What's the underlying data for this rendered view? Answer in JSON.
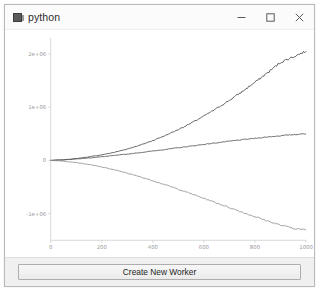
{
  "window": {
    "title": "python",
    "icon": "python-app-icon",
    "controls": [
      {
        "name": "minimize-button",
        "label": "–"
      },
      {
        "name": "maximize-button",
        "label": "□"
      },
      {
        "name": "close-button",
        "label": "×"
      }
    ]
  },
  "bottom_bar": {
    "create_worker_label": "Create New Worker"
  },
  "chart_data": {
    "type": "line",
    "title": "",
    "xlabel": "",
    "ylabel": "",
    "xlim": [
      0,
      1000
    ],
    "ylim": [
      -1500000,
      2300000
    ],
    "grid": false,
    "legend": "none",
    "xticks": [
      0,
      200,
      400,
      600,
      800,
      1000
    ],
    "xticklabels": [
      "0",
      "200",
      "400",
      "600",
      "800",
      "1000"
    ],
    "yticks": [
      -1000000,
      0,
      1000000,
      2000000
    ],
    "yticklabels": [
      "-1e+06",
      "0",
      "1e+06",
      "2e+06"
    ],
    "x": [
      0,
      50,
      100,
      150,
      200,
      250,
      300,
      350,
      400,
      450,
      500,
      550,
      600,
      650,
      700,
      750,
      800,
      850,
      900,
      950,
      1000
    ],
    "series": [
      {
        "name": "worker-1",
        "color": "#4a4a4a",
        "values": [
          0,
          12000,
          34000,
          66000,
          104000,
          152000,
          214000,
          286000,
          372000,
          470000,
          580000,
          700000,
          832000,
          976000,
          1128000,
          1292000,
          1466000,
          1648000,
          1840000,
          1946000,
          2050000
        ]
      },
      {
        "name": "worker-2",
        "color": "#555555",
        "values": [
          0,
          10000,
          26000,
          46000,
          68000,
          92000,
          118000,
          146000,
          176000,
          206000,
          238000,
          268000,
          300000,
          330000,
          360000,
          388000,
          414000,
          440000,
          462000,
          484000,
          500000
        ]
      },
      {
        "name": "worker-3",
        "color": "#8f8f8f",
        "values": [
          0,
          -14000,
          -40000,
          -78000,
          -124000,
          -178000,
          -240000,
          -308000,
          -382000,
          -460000,
          -542000,
          -626000,
          -712000,
          -800000,
          -886000,
          -972000,
          -1056000,
          -1138000,
          -1216000,
          -1272000,
          -1310000
        ]
      }
    ]
  }
}
